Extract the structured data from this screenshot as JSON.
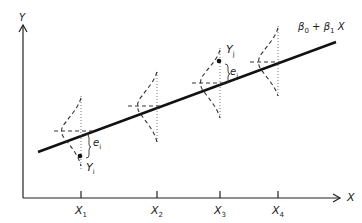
{
  "figure": {
    "title": "",
    "y_axis_label": "Y",
    "x_axis_label": "X",
    "regression_label": {
      "b0": "β",
      "b0_sub": "0",
      "plus": "+",
      "b1": "β",
      "b1_sub": "1",
      "x": "X"
    },
    "ticks": [
      {
        "label": "X",
        "sub": "1"
      },
      {
        "label": "X",
        "sub": "2"
      },
      {
        "label": "X",
        "sub": "3"
      },
      {
        "label": "X",
        "sub": "4"
      }
    ],
    "annotations": {
      "obs_low": {
        "y": "Y",
        "y_sub": "i",
        "e": "e",
        "e_sub": "i"
      },
      "obs_high": {
        "y": "Y",
        "y_sub": "j",
        "e": "e",
        "e_sub": "j"
      }
    },
    "colors": {
      "line": "#111111",
      "dash": "#333333",
      "axis": "#222222"
    }
  }
}
